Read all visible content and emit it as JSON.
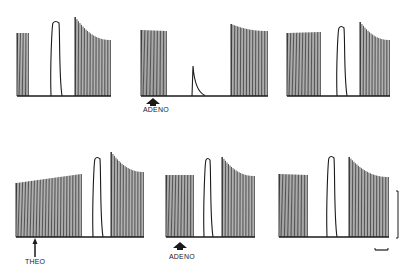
{
  "figure": {
    "labels": {
      "adeno_top": "ADENO",
      "theo": "THEO",
      "adeno_bottom": "ADENO"
    },
    "markers": {
      "adeno_top": {
        "type": "filled-arrow-up",
        "x": 153,
        "y": 98
      },
      "theo": {
        "type": "thin-arrow-up",
        "x": 35,
        "y": 238
      },
      "adeno_bottom": {
        "type": "filled-arrow-up",
        "x": 180,
        "y": 242
      }
    },
    "scale_bars": {
      "vertical": {
        "x": 398,
        "y1": 191,
        "y2": 238
      },
      "horizontal": {
        "x1": 375,
        "x2": 388,
        "y": 250
      }
    },
    "ink_color": "#1a1a1a",
    "rows": [
      {
        "name": "top",
        "baseline": 96,
        "segments": [
          {
            "kind": "twitch-train",
            "x0": 17,
            "x1": 28,
            "top0": 33,
            "top1": 33,
            "bot_shift": 0
          },
          {
            "kind": "contracture",
            "x0": 51,
            "x1": 60,
            "peak": 22
          },
          {
            "kind": "twitch-train",
            "x0": 75,
            "x1": 110,
            "top0": 17,
            "top1": 40,
            "curved": true
          },
          {
            "kind": "twitch-train",
            "x0": 141,
            "x1": 166,
            "top0": 30,
            "top1": 31
          },
          {
            "kind": "spike",
            "x": 193,
            "peak": 66
          },
          {
            "kind": "twitch-train",
            "x0": 231,
            "x1": 267,
            "top0": 24,
            "top1": 31,
            "curved": true
          },
          {
            "kind": "twitch-train",
            "x0": 287,
            "x1": 320,
            "top0": 33,
            "top1": 32
          },
          {
            "kind": "contracture",
            "x0": 337,
            "x1": 345,
            "peak": 27
          },
          {
            "kind": "twitch-train",
            "x0": 360,
            "x1": 389,
            "top0": 22,
            "top1": 40,
            "curved": true
          }
        ]
      },
      {
        "name": "bottom",
        "baseline": 237,
        "segments": [
          {
            "kind": "twitch-train",
            "x0": 16,
            "x1": 81,
            "top0": 183,
            "top1": 174
          },
          {
            "kind": "contracture",
            "x0": 93,
            "x1": 101,
            "peak": 158
          },
          {
            "kind": "twitch-train",
            "x0": 111,
            "x1": 143,
            "top0": 152,
            "top1": 172,
            "curved": true
          },
          {
            "kind": "twitch-train",
            "x0": 166,
            "x1": 193,
            "top0": 175,
            "top1": 175
          },
          {
            "kind": "contracture",
            "x0": 204,
            "x1": 211,
            "peak": 159
          },
          {
            "kind": "twitch-train",
            "x0": 222,
            "x1": 254,
            "top0": 157,
            "top1": 176,
            "curved": true
          },
          {
            "kind": "twitch-train",
            "x0": 279,
            "x1": 307,
            "top0": 174,
            "top1": 175
          },
          {
            "kind": "contracture",
            "x0": 327,
            "x1": 335,
            "peak": 157
          },
          {
            "kind": "twitch-train",
            "x0": 349,
            "x1": 388,
            "top0": 157,
            "top1": 177,
            "curved": true
          }
        ]
      }
    ]
  }
}
